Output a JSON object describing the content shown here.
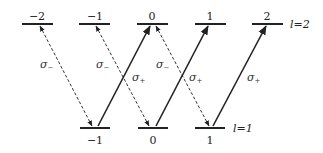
{
  "diagram": {
    "type": "energy-level transition diagram",
    "upper_manifold": {
      "label": "l=2",
      "levels": [
        {
          "m": "−2",
          "x1": 22,
          "x2": 53
        },
        {
          "m": "−1",
          "x1": 79,
          "x2": 110
        },
        {
          "m": "0",
          "x1": 137,
          "x2": 168
        },
        {
          "m": "1",
          "x1": 195,
          "x2": 226
        },
        {
          "m": "2",
          "x1": 252,
          "x2": 283
        }
      ]
    },
    "lower_manifold": {
      "label": "l=1",
      "levels": [
        {
          "m": "−1",
          "x1": 80,
          "x2": 110
        },
        {
          "m": "0",
          "x1": 138,
          "x2": 168
        },
        {
          "m": "1",
          "x1": 195,
          "x2": 225
        }
      ]
    },
    "transitions": [
      {
        "from": "l=2,m=−2",
        "to": "l=1,m=−1",
        "type": "σ−",
        "style": "dashed",
        "label": "σ−"
      },
      {
        "from": "l=2,m=−1",
        "to": "l=1,m=0",
        "type": "σ−",
        "style": "dashed",
        "label": "σ−"
      },
      {
        "from": "l=2,m=0",
        "to": "l=1,m=1",
        "type": "σ−",
        "style": "dashed",
        "label": "σ−"
      },
      {
        "from": "l=1,m=−1",
        "to": "l=2,m=0",
        "type": "σ+",
        "style": "solid",
        "label": "σ+"
      },
      {
        "from": "l=1,m=0",
        "to": "l=2,m=1",
        "type": "σ+",
        "style": "solid",
        "label": "σ+"
      },
      {
        "from": "l=1,m=1",
        "to": "l=2,m=2",
        "type": "σ+",
        "style": "solid",
        "label": "σ+"
      }
    ],
    "sigma_minus_symbol": "σ",
    "sigma_minus_sub": "−",
    "sigma_plus_symbol": "σ",
    "sigma_plus_sub": "+"
  }
}
